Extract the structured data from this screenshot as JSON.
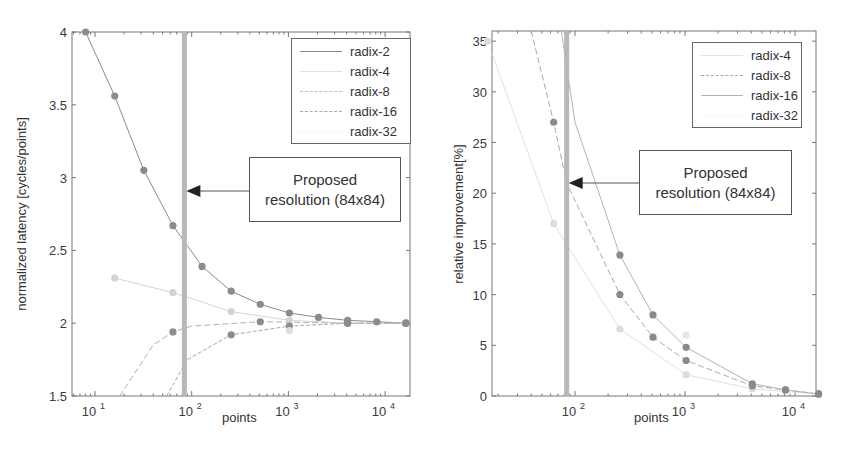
{
  "chart_data": [
    {
      "type": "line",
      "title": "",
      "xlabel": "points",
      "ylabel": "normalized latency [cycles/points]",
      "xscale": "log",
      "xlim": [
        5.8,
        18000
      ],
      "ylim": [
        1.5,
        4
      ],
      "yticks": [
        "1.5",
        "2",
        "2.5",
        "3",
        "3.5",
        "4"
      ],
      "xticks": [
        "10^1",
        "10^2",
        "10^3",
        "10^4"
      ],
      "grid": false,
      "legend_position": "top-right",
      "series": [
        {
          "name": "radix-2",
          "color": "#8a8a8a",
          "marker_color": "#8c8c8c",
          "x": [
            8,
            16,
            32,
            64,
            128,
            256,
            512,
            1024,
            2048,
            4096,
            8192,
            16384
          ],
          "y": [
            4.0,
            3.56,
            3.05,
            2.67,
            2.39,
            2.22,
            2.13,
            2.07,
            2.04,
            2.02,
            2.01,
            2.0
          ]
        },
        {
          "name": "radix-4",
          "color": "#d6d6d6",
          "marker_color": "#d2d2d2",
          "x": [
            16,
            64,
            256,
            1024,
            4096,
            16384
          ],
          "y": [
            2.31,
            2.21,
            2.08,
            2.02,
            2.0,
            2.0
          ]
        },
        {
          "name": "radix-8",
          "color": "#b0b0b0",
          "marker_color": "#8c8c8c",
          "x": [
            18,
            40,
            64,
            100,
            512,
            4096,
            16384
          ],
          "y": [
            1.5,
            1.85,
            1.94,
            1.98,
            2.01,
            2.0,
            2.0
          ]
        },
        {
          "name": "radix-16",
          "color": "#a8a8a8",
          "marker_color": "#8c8c8c",
          "x": [
            55,
            90,
            256,
            1024,
            4096,
            16384
          ],
          "y": [
            1.5,
            1.75,
            1.92,
            1.98,
            2.0,
            2.0
          ]
        },
        {
          "name": "radix-32",
          "color": "#e4e4e4",
          "marker_color": "#dddddd",
          "x": [
            1024
          ],
          "y": [
            1.95
          ]
        }
      ],
      "annotation": {
        "text_line1": "Proposed",
        "text_line2": "resolution (84x84)",
        "x": 84,
        "y": 2.9
      },
      "marker_line_x": 84
    },
    {
      "type": "line",
      "title": "",
      "xlabel": "points",
      "ylabel": "relative improvement[%]",
      "xscale": "log",
      "xlim": [
        17.6,
        15500
      ],
      "ylim": [
        0,
        36
      ],
      "yticks": [
        "0",
        "5",
        "10",
        "15",
        "20",
        "25",
        "30",
        "35"
      ],
      "xticks": [
        "10^2",
        "10^3",
        "10^4"
      ],
      "grid": false,
      "legend_position": "top-right",
      "series": [
        {
          "name": "radix-4",
          "color": "#e0e0e0",
          "marker_color": "#dcdcdc",
          "x": [
            16,
            64,
            256,
            1024,
            4096,
            16384
          ],
          "y": [
            35,
            17,
            6.6,
            2.1,
            0.7,
            0.2
          ]
        },
        {
          "name": "radix-8",
          "color": "#aaaaaa",
          "marker_color": "#8a8a8a",
          "x": [
            40,
            64,
            84,
            256,
            512,
            1024,
            4096,
            8192,
            16384
          ],
          "y": [
            36,
            27,
            21,
            10,
            5.8,
            3.5,
            1.0,
            0.6,
            0.2
          ]
        },
        {
          "name": "radix-16",
          "color": "#b4b4b4",
          "marker_color": "#8a8a8a",
          "x": [
            75,
            100,
            256,
            512,
            1024,
            4096,
            8192,
            16384
          ],
          "y": [
            36,
            27,
            13.9,
            8.0,
            4.8,
            1.2,
            0.6,
            0.2
          ]
        },
        {
          "name": "radix-32",
          "color": "#ececec",
          "marker_color": "#e6e6e6",
          "x": [
            1024
          ],
          "y": [
            6.0
          ]
        }
      ],
      "annotation": {
        "text_line1": "Proposed",
        "text_line2": "resolution (84x84)",
        "x": 84,
        "y": 21
      },
      "marker_line_x": 84
    }
  ],
  "left_plot": {
    "xlabel": "points",
    "ylabel": "normalized latency [cycles/points]",
    "yticks": [
      "1.5",
      "2",
      "2.5",
      "3",
      "3.5",
      "4"
    ],
    "xticks": [
      {
        "base": "10",
        "exp": "1"
      },
      {
        "base": "10",
        "exp": "2"
      },
      {
        "base": "10",
        "exp": "3"
      },
      {
        "base": "10",
        "exp": "4"
      }
    ],
    "legend": [
      "radix-2",
      "radix-4",
      "radix-8",
      "radix-16",
      "radix-32"
    ],
    "annotation": {
      "line1": "Proposed",
      "line2": "resolution (84x84)"
    }
  },
  "right_plot": {
    "xlabel": "points",
    "ylabel": "relative improvement[%]",
    "yticks": [
      "0",
      "5",
      "10",
      "15",
      "20",
      "25",
      "30",
      "35"
    ],
    "xticks": [
      {
        "base": "10",
        "exp": "2"
      },
      {
        "base": "10",
        "exp": "3"
      },
      {
        "base": "10",
        "exp": "4"
      }
    ],
    "legend": [
      "radix-4",
      "radix-8",
      "radix-16",
      "radix-32"
    ],
    "annotation": {
      "line1": "Proposed",
      "line2": "resolution (84x84)"
    }
  },
  "colors": {
    "axis": "#777777",
    "highlight_bar": "#b8b8b8",
    "arrow": "#222222"
  }
}
